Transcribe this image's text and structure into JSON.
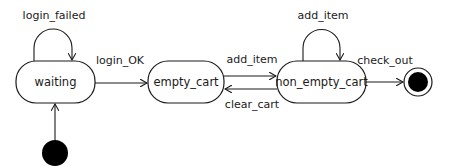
{
  "diagram": {
    "type": "state_machine",
    "colors": {
      "stroke": "#1a1a1a",
      "fill": "#ffffff",
      "pseudo_state": "#000000"
    },
    "states": [
      {
        "id": "waiting",
        "label": "waiting"
      },
      {
        "id": "empty_cart",
        "label": "empty_cart"
      },
      {
        "id": "non_empty_cart",
        "label": "non_empty_cart"
      }
    ],
    "initial_state": {
      "target": "waiting"
    },
    "final_state": {
      "source": "non_empty_cart"
    },
    "transitions": [
      {
        "from": "waiting",
        "to": "waiting",
        "label": "login_failed"
      },
      {
        "from": "waiting",
        "to": "empty_cart",
        "label": "login_OK"
      },
      {
        "from": "empty_cart",
        "to": "non_empty_cart",
        "label": "add_item"
      },
      {
        "from": "non_empty_cart",
        "to": "empty_cart",
        "label": "clear_cart"
      },
      {
        "from": "non_empty_cart",
        "to": "non_empty_cart",
        "label": "add_item"
      },
      {
        "from": "non_empty_cart",
        "to": "final",
        "label": "check_out"
      }
    ]
  }
}
